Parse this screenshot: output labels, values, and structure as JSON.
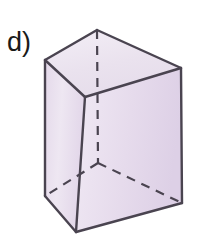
{
  "figure": {
    "label": "d)",
    "shape_name": "triangular-prism",
    "projection": "oblique",
    "background_color": "#ffffff",
    "face_colors": {
      "top": "#ece4f0",
      "left_front": "#e6dcec",
      "right_front": "#e3d8ea",
      "left_front_light": "#f2ecf5",
      "right_front_light": "#efe7f3"
    },
    "edge_colors": {
      "visible": "#4a4450",
      "hidden": "#4a4450"
    },
    "edge_widths": {
      "visible": 2.4,
      "hidden": 2.2
    },
    "hidden_dash_pattern": "9,7",
    "vertices": {
      "top_back_apex": [
        97,
        30
      ],
      "top_left": [
        45,
        60
      ],
      "top_right": [
        181,
        68
      ],
      "top_front": [
        85,
        97
      ],
      "bottom_left": [
        45,
        196
      ],
      "bottom_right": [
        182,
        203
      ],
      "bottom_front": [
        76,
        232
      ],
      "bottom_back_apex": [
        98,
        163
      ]
    },
    "visible_edges": [
      "top_left-top_back_apex",
      "top_back_apex-top_right",
      "top_left-top_front",
      "top_front-top_right",
      "top_left-bottom_left",
      "top_front-bottom_front",
      "top_right-bottom_right",
      "bottom_left-bottom_front",
      "bottom_front-bottom_right"
    ],
    "hidden_edges": [
      "top_back_apex-bottom_back_apex",
      "bottom_back_apex-bottom_left",
      "bottom_back_apex-bottom_right"
    ]
  }
}
